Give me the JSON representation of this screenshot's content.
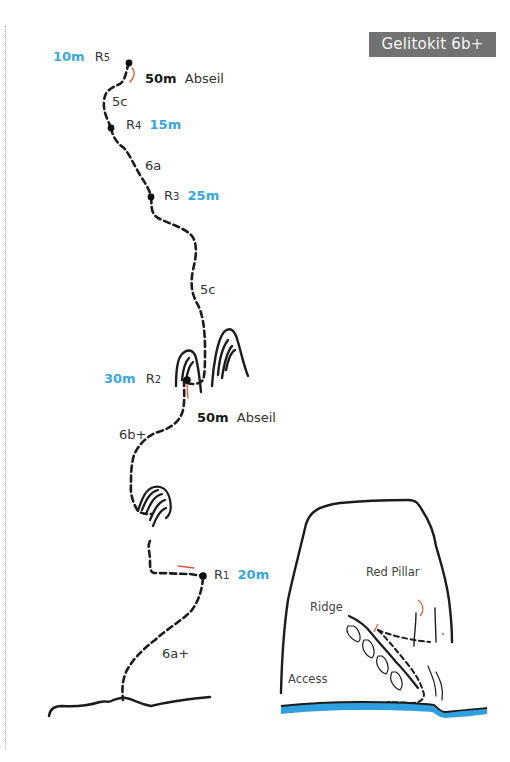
{
  "title": "Gelitokit 6b+",
  "colors": {
    "line": "#1c1c1c",
    "length_blue": "#3aa7dc",
    "abseil_red": "#e0553a",
    "water_blue": "#2f9fe0",
    "badge_bg": "#727272"
  },
  "belays": [
    {
      "id": "R5",
      "prefix": "R",
      "num": "5",
      "length": "10m"
    },
    {
      "id": "R4",
      "prefix": "R",
      "num": "4",
      "length": "15m"
    },
    {
      "id": "R3",
      "prefix": "R",
      "num": "3",
      "length": "25m"
    },
    {
      "id": "R2",
      "prefix": "R",
      "num": "2",
      "length": "30m"
    },
    {
      "id": "R1",
      "prefix": "R",
      "num": "1",
      "length": "20m"
    }
  ],
  "pitches": [
    {
      "grade": "5c"
    },
    {
      "grade": "6a"
    },
    {
      "grade": "5c"
    },
    {
      "grade": "6b+"
    },
    {
      "grade": "6a+"
    }
  ],
  "abseils": [
    {
      "length": "50m",
      "label": "Abseil"
    },
    {
      "length": "50m",
      "label": "Abseil"
    }
  ],
  "overview": {
    "labels": {
      "red_pillar": "Red Pillar",
      "ridge": "Ridge",
      "access": "Access"
    }
  }
}
